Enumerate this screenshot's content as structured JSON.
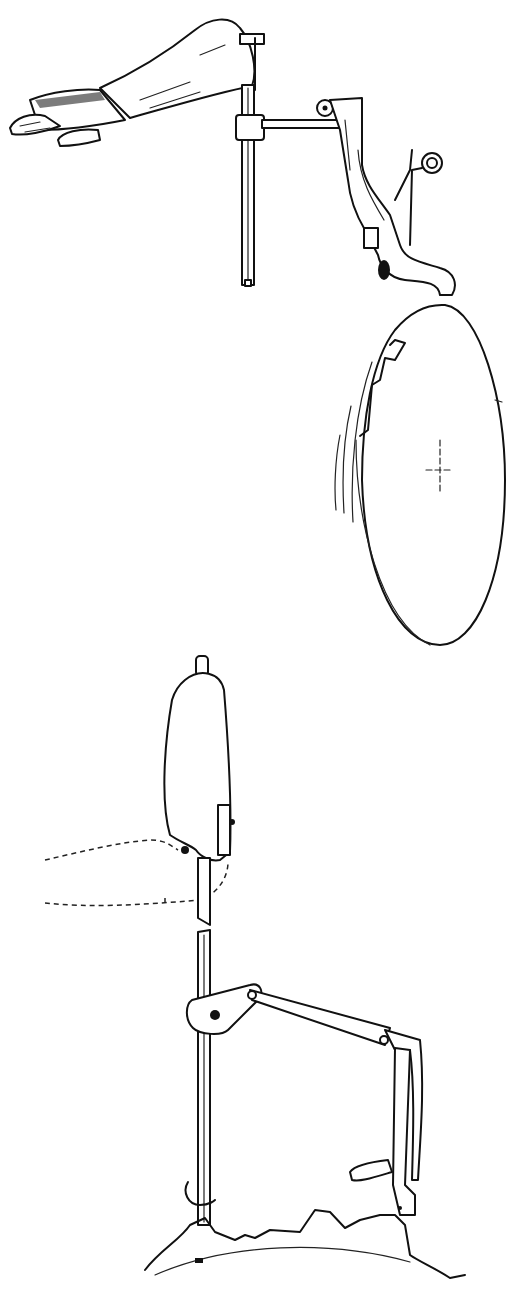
{
  "figure": {
    "type": "line-art technical illustration",
    "background": "#ffffff",
    "stroke_color": "#111111",
    "panels": [
      {
        "id": "top",
        "description": "Forearm and hand resting on a vertical rod, with a horizontal arm linked to a crank-shaped lever and a coil spring; the lever presses on the rim of a notched disc shown in perspective with motion lines",
        "parts": [
          "forearm-hand",
          "vertical-rod",
          "collar",
          "horizontal-arm",
          "crank-lever",
          "coil-spring",
          "notched-disc",
          "motion-lines",
          "center-cross"
        ]
      },
      {
        "id": "bottom",
        "description": "Weighted cam body on a vertical rod, with a dashed outline showing an alternate position; a collar and linkage arm connect to a bent lever that follows an irregular profiled track",
        "parts": [
          "cam-body",
          "rod-top-stub",
          "dashed-alternate-position",
          "broken-rod",
          "collar",
          "link-arm",
          "bent-lever",
          "follower-tab",
          "profiled-track"
        ]
      }
    ]
  }
}
